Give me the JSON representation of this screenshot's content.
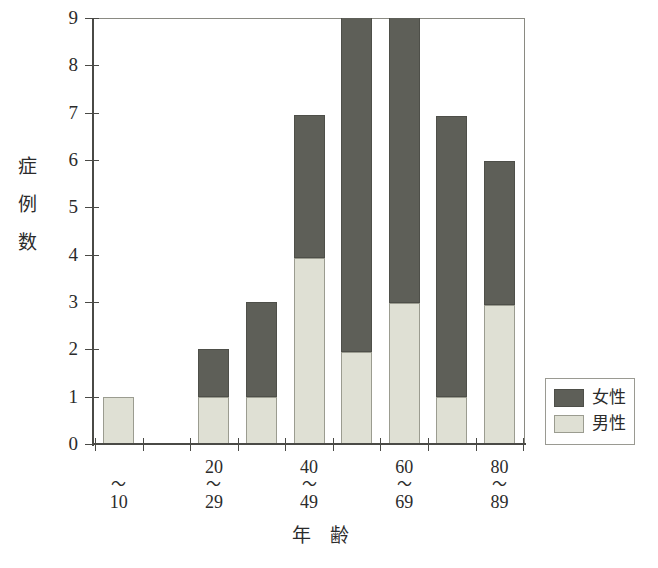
{
  "chart_data": {
    "type": "bar",
    "stacked": true,
    "title": "",
    "xlabel": "年　齢",
    "ylabel": "症例数",
    "ylabel_chars": [
      "症",
      "例",
      "数"
    ],
    "categories": [
      "～10",
      "10～19",
      "20～29",
      "30～39",
      "40～49",
      "50～59",
      "60～69",
      "70～79",
      "80～89"
    ],
    "category_labels": [
      {
        "upper": "",
        "tilde": "～",
        "lower": "10"
      },
      {
        "upper": "",
        "tilde": "",
        "lower": ""
      },
      {
        "upper": "20",
        "tilde": "～",
        "lower": "29"
      },
      {
        "upper": "",
        "tilde": "",
        "lower": ""
      },
      {
        "upper": "40",
        "tilde": "～",
        "lower": "49"
      },
      {
        "upper": "",
        "tilde": "",
        "lower": ""
      },
      {
        "upper": "60",
        "tilde": "～",
        "lower": "69"
      },
      {
        "upper": "",
        "tilde": "",
        "lower": ""
      },
      {
        "upper": "80",
        "tilde": "～",
        "lower": "89"
      }
    ],
    "series": [
      {
        "name": "男性",
        "color": "#dfe0d4",
        "values": [
          1.0,
          0,
          1.0,
          1.0,
          3.93,
          1.94,
          2.98,
          0.99,
          2.94
        ]
      },
      {
        "name": "女性",
        "color": "#5e5f58",
        "values": [
          0,
          0,
          1.0,
          2.0,
          3.02,
          7.5,
          6.5,
          5.94,
          3.04
        ]
      }
    ],
    "totals": [
      1.0,
      0,
      2.0,
      3.0,
      6.95,
      9.44,
      9.48,
      6.93,
      5.98
    ],
    "ylim": [
      0,
      9
    ],
    "yticks": [
      0,
      1,
      2,
      3,
      4,
      5,
      6,
      7,
      8,
      9
    ],
    "ytick_labels": [
      "0",
      "1",
      "2",
      "3",
      "4",
      "5",
      "6",
      "7",
      "8",
      "9"
    ],
    "grid": false,
    "legend": {
      "position": "right",
      "entries": [
        {
          "label": "女性",
          "color": "#5e5f58"
        },
        {
          "label": "男性",
          "color": "#dfe0d4"
        }
      ]
    },
    "note": "Bars for 50～59 and 60～69 are clipped at the top of the plot frame (exceed axis maximum 9)."
  },
  "colors": {
    "female": "#5e5f58",
    "male": "#dfe0d4",
    "axis": "#4a4a46",
    "frame": "#8a8a82",
    "text": "#2b2b2b",
    "background": "#ffffff"
  }
}
